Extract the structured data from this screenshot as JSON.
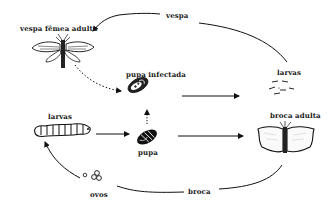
{
  "diagram": {
    "title": "",
    "nodes": [
      {
        "id": "vespa_femea_adulta",
        "label": "vespa fêmea adulta",
        "icon": "wasp-icon"
      },
      {
        "id": "pupa_infectada",
        "label": "pupa infectada",
        "icon": "infected-pupa-icon"
      },
      {
        "id": "larvas_vespa",
        "label": "larvas",
        "icon": "wasp-larvae-icon"
      },
      {
        "id": "larvas_broca",
        "label": "larvas",
        "icon": "caterpillar-icon"
      },
      {
        "id": "pupa",
        "label": "pupa",
        "icon": "pupa-icon"
      },
      {
        "id": "broca_adulta",
        "label": "broca adulta",
        "icon": "moth-icon"
      },
      {
        "id": "ovos",
        "label": "ovos",
        "icon": "eggs-icon"
      }
    ],
    "edges": [
      {
        "from": "larvas_vespa",
        "to": "vespa_femea_adulta",
        "label": "vespa",
        "style": "solid-curve"
      },
      {
        "from": "vespa_femea_adulta",
        "to": "pupa_infectada",
        "label": "",
        "style": "dotted"
      },
      {
        "from": "pupa_infectada",
        "to": "larvas_vespa",
        "label": "",
        "style": "solid"
      },
      {
        "from": "pupa",
        "to": "pupa_infectada",
        "label": "",
        "style": "dotted"
      },
      {
        "from": "larvas_broca",
        "to": "pupa",
        "label": "",
        "style": "solid"
      },
      {
        "from": "pupa",
        "to": "broca_adulta",
        "label": "",
        "style": "solid"
      },
      {
        "from": "broca_adulta",
        "to": "ovos",
        "label": "broca",
        "style": "solid-curve"
      },
      {
        "from": "ovos",
        "to": "larvas_broca",
        "label": "",
        "style": "solid-curve"
      }
    ],
    "cycle_labels": {
      "wasp": "vespa",
      "borer": "broca"
    }
  }
}
